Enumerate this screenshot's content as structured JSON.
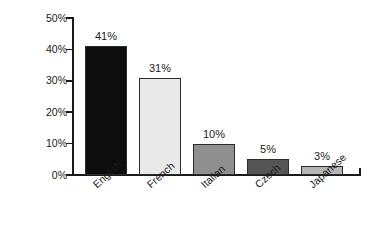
{
  "chart_data": {
    "type": "bar",
    "title": "",
    "subtitle": "",
    "xlabel": "",
    "ylabel": "% of companies",
    "categories": [
      "English",
      "French",
      "Italian",
      "Czech",
      "Japanese"
    ],
    "values": [
      41,
      31,
      10,
      5,
      3
    ],
    "value_labels": [
      "41%",
      "31%",
      "10%",
      "5%",
      "3%"
    ],
    "bar_colors": [
      "#0d0d0d",
      "#e9e9e9",
      "#8f8f8f",
      "#555555",
      "#b6b6b6"
    ],
    "bar_border_color": "#2b2b2b",
    "ylim": [
      0,
      50
    ],
    "yticks": [
      0,
      10,
      20,
      30,
      40,
      50
    ],
    "ytick_labels": [
      "0%",
      "10%",
      "20%",
      "30%",
      "40%",
      "50%"
    ],
    "grid": false,
    "legend": "none",
    "axis_color": "#1a1a1a",
    "background": "#ffffff"
  }
}
